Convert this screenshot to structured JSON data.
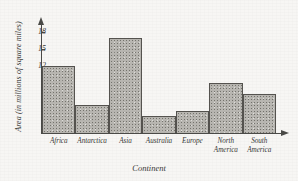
{
  "chart_data": {
    "type": "bar",
    "title": "",
    "xlabel": "Continent",
    "ylabel": "Area (in millions of square miles)",
    "categories": [
      "Africa",
      "Antarctica",
      "Asia",
      "Australia",
      "Europe",
      "North America",
      "South America"
    ],
    "values": [
      12,
      5,
      17,
      3,
      4,
      9,
      7
    ],
    "yticks": [
      3,
      6,
      9,
      12,
      15,
      18
    ],
    "ylim": [
      0,
      19.5
    ],
    "grid": false,
    "legend": "none",
    "bars_adjacent": true,
    "bar_fill": "#b9b7b2",
    "bar_edge": "#55534f",
    "axis_color": "#4a4a47",
    "background": "#f7f6f4"
  },
  "axes": {
    "y_arrow": "arrow-up-icon",
    "x_arrow": "arrow-right-icon"
  },
  "xtick_lines": [
    [
      "Africa"
    ],
    [
      "Antarctica"
    ],
    [
      "Asia"
    ],
    [
      "Australia"
    ],
    [
      "Europe"
    ],
    [
      "North",
      "America"
    ],
    [
      "South",
      "America"
    ]
  ]
}
